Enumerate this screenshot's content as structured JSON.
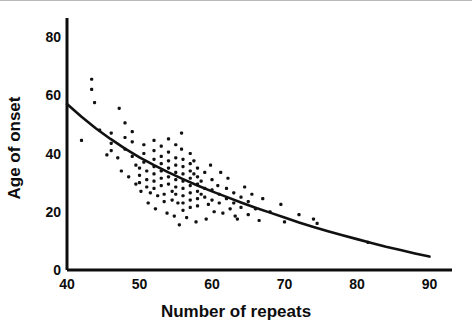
{
  "chart_data": {
    "type": "scatter",
    "title": "",
    "xlabel": "Number of repeats",
    "ylabel": "Age of onset",
    "xlim": [
      40,
      90
    ],
    "ylim": [
      0,
      85
    ],
    "xticks": [
      40,
      50,
      60,
      70,
      80,
      90
    ],
    "yticks": [
      0,
      20,
      40,
      60,
      80
    ],
    "xtick_labels": [
      "40",
      "50",
      "60",
      "70",
      "80",
      "90"
    ],
    "ytick_labels": [
      "0",
      "20",
      "40",
      "60",
      "80"
    ],
    "grid": false,
    "legend": "none",
    "axis_color": "#0d0d0d",
    "point_color": "#111111",
    "curve_color": "#111111",
    "background_color": "#ffffff",
    "marker_size_px": 3,
    "series": [
      {
        "name": "patients",
        "type": "scatter",
        "points": [
          [
            43.4,
            65.5
          ],
          [
            43.4,
            62.0
          ],
          [
            43.8,
            57.5
          ],
          [
            47.2,
            55.5
          ],
          [
            42.0,
            44.5
          ],
          [
            44.5,
            48.0
          ],
          [
            46.1,
            47.0
          ],
          [
            46.1,
            43.5
          ],
          [
            46.1,
            41.0
          ],
          [
            47.0,
            38.5
          ],
          [
            48.0,
            50.5
          ],
          [
            48.0,
            45.5
          ],
          [
            48.0,
            41.5
          ],
          [
            49.0,
            47.5
          ],
          [
            49.0,
            44.0
          ],
          [
            49.0,
            39.0
          ],
          [
            49.5,
            36.0
          ],
          [
            50.0,
            35.0
          ],
          [
            50.0,
            32.5
          ],
          [
            50.0,
            30.0
          ],
          [
            50.6,
            43.0
          ],
          [
            50.6,
            40.0
          ],
          [
            50.6,
            37.0
          ],
          [
            51.0,
            34.0
          ],
          [
            51.0,
            31.0
          ],
          [
            51.0,
            28.5
          ],
          [
            51.5,
            26.5
          ],
          [
            52.0,
            44.5
          ],
          [
            52.0,
            41.0
          ],
          [
            52.0,
            38.0
          ],
          [
            52.0,
            35.5
          ],
          [
            52.0,
            33.0
          ],
          [
            52.0,
            30.5
          ],
          [
            52.0,
            28.0
          ],
          [
            52.5,
            25.5
          ],
          [
            53.0,
            42.5
          ],
          [
            53.0,
            39.0
          ],
          [
            53.0,
            36.5
          ],
          [
            53.0,
            34.0
          ],
          [
            53.0,
            31.5
          ],
          [
            53.0,
            29.0
          ],
          [
            53.4,
            26.0
          ],
          [
            53.4,
            23.5
          ],
          [
            54.0,
            45.0
          ],
          [
            54.0,
            40.5
          ],
          [
            54.0,
            37.5
          ],
          [
            54.0,
            35.0
          ],
          [
            54.0,
            32.0
          ],
          [
            54.0,
            29.5
          ],
          [
            54.5,
            27.0
          ],
          [
            54.5,
            24.0
          ],
          [
            55.0,
            43.0
          ],
          [
            55.0,
            38.5
          ],
          [
            55.0,
            36.0
          ],
          [
            55.0,
            33.5
          ],
          [
            55.0,
            31.0
          ],
          [
            55.0,
            28.5
          ],
          [
            55.0,
            26.0
          ],
          [
            55.3,
            23.0
          ],
          [
            55.8,
            47.0
          ],
          [
            55.8,
            41.5
          ],
          [
            56.0,
            38.0
          ],
          [
            56.0,
            35.5
          ],
          [
            56.0,
            33.0
          ],
          [
            56.0,
            30.5
          ],
          [
            56.0,
            28.0
          ],
          [
            56.0,
            25.5
          ],
          [
            56.0,
            23.0
          ],
          [
            56.0,
            20.5
          ],
          [
            56.5,
            18.0
          ],
          [
            57.0,
            40.0
          ],
          [
            57.0,
            36.5
          ],
          [
            57.0,
            34.0
          ],
          [
            57.0,
            31.5
          ],
          [
            57.0,
            29.0
          ],
          [
            57.0,
            26.5
          ],
          [
            57.0,
            24.0
          ],
          [
            57.0,
            21.5
          ],
          [
            57.5,
            37.5
          ],
          [
            57.5,
            33.0
          ],
          [
            58.0,
            35.0
          ],
          [
            58.0,
            32.0
          ],
          [
            58.0,
            29.5
          ],
          [
            58.0,
            27.0
          ],
          [
            58.0,
            24.5
          ],
          [
            58.0,
            22.0
          ],
          [
            58.5,
            30.5
          ],
          [
            58.5,
            26.0
          ],
          [
            59.0,
            33.5
          ],
          [
            59.0,
            28.0
          ],
          [
            59.0,
            25.0
          ],
          [
            59.5,
            22.5
          ],
          [
            60.0,
            31.0
          ],
          [
            60.0,
            27.5
          ],
          [
            60.0,
            24.0
          ],
          [
            60.3,
            20.0
          ],
          [
            60.8,
            29.0
          ],
          [
            61.0,
            26.0
          ],
          [
            61.0,
            23.0
          ],
          [
            61.5,
            19.5
          ],
          [
            62.0,
            28.0
          ],
          [
            62.0,
            24.5
          ],
          [
            62.5,
            21.0
          ],
          [
            63.0,
            26.5
          ],
          [
            63.0,
            23.0
          ],
          [
            63.5,
            17.5
          ],
          [
            64.0,
            25.0
          ],
          [
            64.0,
            21.5
          ],
          [
            64.5,
            28.5
          ],
          [
            65.0,
            23.5
          ],
          [
            65.0,
            19.0
          ],
          [
            65.5,
            26.0
          ],
          [
            66.0,
            21.0
          ],
          [
            66.5,
            17.0
          ],
          [
            67.0,
            24.5
          ],
          [
            68.0,
            20.0
          ],
          [
            69.5,
            22.5
          ],
          [
            70.0,
            16.5
          ],
          [
            72.0,
            19.0
          ],
          [
            74.0,
            17.5
          ],
          [
            74.5,
            16.0
          ],
          [
            81.5,
            9.5
          ],
          [
            45.5,
            39.5
          ],
          [
            47.5,
            34.0
          ],
          [
            48.5,
            32.0
          ],
          [
            49.5,
            29.5
          ],
          [
            50.2,
            27.0
          ],
          [
            51.2,
            23.0
          ],
          [
            52.2,
            21.0
          ],
          [
            53.8,
            19.5
          ],
          [
            54.8,
            18.5
          ],
          [
            59.8,
            36.0
          ],
          [
            61.2,
            33.5
          ],
          [
            62.2,
            31.5
          ],
          [
            63.2,
            18.5
          ],
          [
            55.5,
            15.5
          ],
          [
            57.8,
            16.5
          ],
          [
            59.2,
            17.5
          ]
        ]
      },
      {
        "name": "fitted-curve",
        "type": "line",
        "description": "exponential decay fit",
        "points": [
          [
            40,
            57.0
          ],
          [
            42,
            52.6
          ],
          [
            44,
            48.6
          ],
          [
            46,
            45.0
          ],
          [
            48,
            41.7
          ],
          [
            50,
            38.7
          ],
          [
            52,
            36.0
          ],
          [
            54,
            33.5
          ],
          [
            56,
            31.2
          ],
          [
            58,
            29.0
          ],
          [
            60,
            27.0
          ],
          [
            62,
            25.1
          ],
          [
            64,
            23.2
          ],
          [
            66,
            21.4
          ],
          [
            68,
            19.7
          ],
          [
            70,
            18.0
          ],
          [
            72,
            16.3
          ],
          [
            74,
            14.8
          ],
          [
            76,
            13.3
          ],
          [
            78,
            11.9
          ],
          [
            80,
            10.6
          ],
          [
            82,
            9.3
          ],
          [
            84,
            8.0
          ],
          [
            86,
            6.9
          ],
          [
            88,
            5.7
          ],
          [
            90,
            4.6
          ]
        ]
      }
    ]
  },
  "axes": {
    "x_title": "Number of repeats",
    "y_title": "Age of onset",
    "x_ticks": [
      "40",
      "50",
      "60",
      "70",
      "80",
      "90"
    ],
    "y_ticks": [
      "80",
      "60",
      "40",
      "20",
      "0"
    ]
  }
}
